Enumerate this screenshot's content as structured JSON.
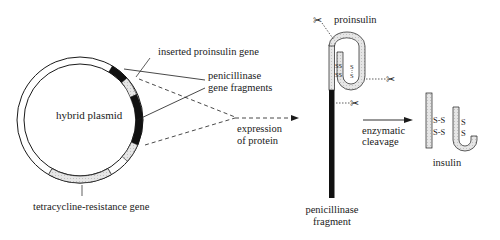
{
  "diagram": {
    "plasmid": {
      "label": "hybrid plasmid",
      "inserted_gene_label": "inserted proinsulin gene",
      "fragments_label_line1": "penicillinase",
      "fragments_label_line2": "gene fragments",
      "resistance_label": "tetracycline-resistance gene"
    },
    "expression": {
      "line1": "expression",
      "line2": "of protein"
    },
    "fusion_protein": {
      "proinsulin_label": "proinsulin",
      "ss_bond_1": "SS",
      "ss_bond_2": "SS",
      "s_top": "S",
      "s_bottom": "S",
      "fragment_line1": "penicillinase",
      "fragment_line2": "fragment"
    },
    "cleavage": {
      "line1": "enzymatic",
      "line2": "cleavage"
    },
    "insulin": {
      "label": "insulin",
      "bond_1": "S-S",
      "bond_2": "S-S",
      "s_top": "S",
      "s_bottom": "S"
    },
    "colors": {
      "ink": "#1a1a1a",
      "hatch_fill": "#e2e2e2",
      "black_segment": "#111111"
    }
  }
}
